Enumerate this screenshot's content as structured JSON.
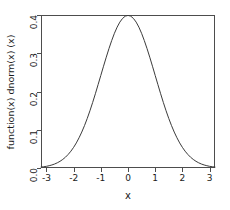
{
  "chart_data": {
    "type": "line",
    "title": "",
    "subtitle": "",
    "xlabel": "x",
    "ylabel": "function(x) dnorm(x) (x)",
    "xlim": [
      -3.2,
      3.2
    ],
    "ylim": [
      0.0,
      0.4
    ],
    "grid": false,
    "legend": null,
    "legend_position": "none",
    "box": "full-rectangle",
    "xticks": [
      -3,
      -2,
      -1,
      0,
      1,
      2,
      3
    ],
    "xticklabels": [
      "-3",
      "-2",
      "-1",
      "0",
      "1",
      "2",
      "3"
    ],
    "yticks": [
      0.0,
      0.1,
      0.2,
      0.3,
      0.4
    ],
    "yticklabels": [
      "0.0",
      "0.1",
      "0.2",
      "0.3",
      "0.4"
    ],
    "series": [
      {
        "name": "dnorm(x)",
        "color": "#3b3b3b",
        "x": [
          -3.2,
          -3.1,
          -3.0,
          -2.9,
          -2.8,
          -2.7,
          -2.6,
          -2.5,
          -2.4,
          -2.3,
          -2.2,
          -2.1,
          -2.0,
          -1.9,
          -1.8,
          -1.7,
          -1.6,
          -1.5,
          -1.4,
          -1.3,
          -1.2,
          -1.1,
          -1.0,
          -0.9,
          -0.8,
          -0.7,
          -0.6,
          -0.5,
          -0.4,
          -0.3,
          -0.2,
          -0.1,
          0.0,
          0.1,
          0.2,
          0.3,
          0.4,
          0.5,
          0.6,
          0.7,
          0.8,
          0.9,
          1.0,
          1.1,
          1.2,
          1.3,
          1.4,
          1.5,
          1.6,
          1.7,
          1.8,
          1.9,
          2.0,
          2.1,
          2.2,
          2.3,
          2.4,
          2.5,
          2.6,
          2.7,
          2.8,
          2.9,
          3.0,
          3.1,
          3.2
        ],
        "y": [
          0.0024,
          0.0033,
          0.0044,
          0.006,
          0.0079,
          0.0104,
          0.0136,
          0.0175,
          0.0224,
          0.0283,
          0.0355,
          0.044,
          0.054,
          0.0656,
          0.079,
          0.094,
          0.1109,
          0.1295,
          0.1497,
          0.1714,
          0.1942,
          0.2179,
          0.242,
          0.2661,
          0.2897,
          0.3123,
          0.3332,
          0.3521,
          0.3683,
          0.3814,
          0.391,
          0.397,
          0.3989,
          0.397,
          0.391,
          0.3814,
          0.3683,
          0.3521,
          0.3332,
          0.3123,
          0.2897,
          0.2661,
          0.242,
          0.2179,
          0.1942,
          0.1714,
          0.1497,
          0.1295,
          0.1109,
          0.094,
          0.079,
          0.0656,
          0.054,
          0.044,
          0.0355,
          0.0283,
          0.0224,
          0.0175,
          0.0136,
          0.0104,
          0.0079,
          0.006,
          0.0044,
          0.0033,
          0.0024
        ]
      }
    ]
  }
}
